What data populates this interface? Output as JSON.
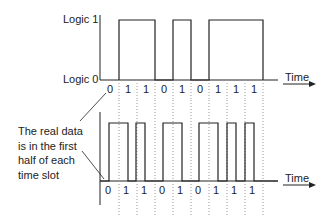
{
  "diagram": {
    "top": {
      "y_label_high": "Logic 1",
      "y_label_low": "Logic 0",
      "x_label": "Time",
      "bits": [
        "0",
        "1",
        "1",
        "0",
        "1",
        "0",
        "1",
        "1",
        "1"
      ],
      "encoding": "NRZ"
    },
    "bottom": {
      "x_label": "Time",
      "bits": [
        "0",
        "1",
        "1",
        "0",
        "1",
        "0",
        "1",
        "1",
        "1"
      ],
      "encoding": "RZ (data in first half of each slot)"
    },
    "annotation": {
      "lines": [
        "The real data",
        "is in the first",
        "half of each",
        "time slot"
      ]
    },
    "colors": {
      "line": "#222222",
      "dotted": "#888888",
      "background": "#ffffff"
    }
  }
}
